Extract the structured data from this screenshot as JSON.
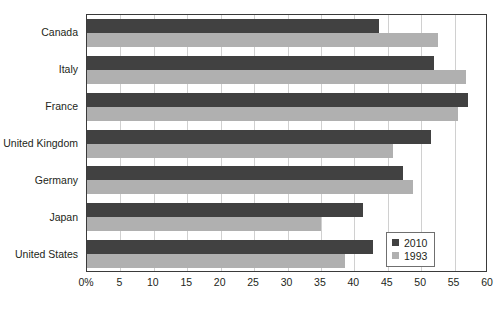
{
  "chart_data": {
    "type": "bar",
    "orientation": "horizontal",
    "title": "",
    "xlabel": "",
    "ylabel": "",
    "xlim": [
      0,
      60
    ],
    "xticks": [
      "0%",
      "5",
      "10",
      "15",
      "20",
      "25",
      "30",
      "35",
      "40",
      "45",
      "50",
      "55",
      "60"
    ],
    "xtick_values": [
      0,
      5,
      10,
      15,
      20,
      25,
      30,
      35,
      40,
      45,
      50,
      55,
      60
    ],
    "grid": true,
    "grid_axis": "x",
    "categories": [
      "Canada",
      "Italy",
      "France",
      "United Kingdom",
      "Germany",
      "Japan",
      "United States"
    ],
    "series": [
      {
        "name": "2010",
        "color": "#414141",
        "values": [
          43.7,
          51.9,
          57.0,
          51.5,
          47.3,
          41.3,
          42.8
        ]
      },
      {
        "name": "1993",
        "color": "#b0b0b0",
        "values": [
          52.5,
          56.7,
          55.5,
          45.8,
          48.8,
          35.0,
          38.6
        ]
      }
    ],
    "legend": {
      "position": "bottom-right",
      "entries": [
        {
          "label": "2010",
          "color": "#414141"
        },
        {
          "label": "1993",
          "color": "#b0b0b0"
        }
      ]
    },
    "colors": {
      "series_2010": "#414141",
      "series_1993": "#b0b0b0",
      "gridline": "#d0d0d0",
      "axis": "#3a3a3a",
      "text": "#231f20",
      "background": "#ffffff"
    }
  }
}
